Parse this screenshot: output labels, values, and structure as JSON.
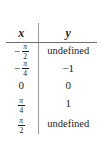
{
  "figure": {
    "kind": "function-value-table",
    "background_color": "#ffffff",
    "rule_color": "#6f6f6f",
    "divider_color": "#9a9a9a",
    "text_color": "#1d1d1d"
  },
  "table": {
    "headers": {
      "x": "x",
      "y": "y"
    },
    "rows": [
      {
        "x_display": "−π/2",
        "x_sign": "−",
        "x_numerator": "π",
        "x_denominator": "2",
        "y_display": "undefined"
      },
      {
        "x_display": "−π/4",
        "x_sign": "−",
        "x_numerator": "π",
        "x_denominator": "4",
        "y_display": "−1"
      },
      {
        "x_display": "0",
        "x_sign": "",
        "x_numerator": "",
        "x_denominator": "",
        "y_display": "0"
      },
      {
        "x_display": "π/4",
        "x_sign": "",
        "x_numerator": "π",
        "x_denominator": "4",
        "y_display": "1"
      },
      {
        "x_display": "π/2",
        "x_sign": "",
        "x_numerator": "π",
        "x_denominator": "2",
        "y_display": "undefined"
      }
    ]
  },
  "chart_data": {
    "type": "table",
    "title": "",
    "xlabel": "x",
    "ylabel": "y",
    "categories": [
      "−π/2",
      "−π/4",
      "0",
      "π/4",
      "π/2"
    ],
    "series": [
      {
        "name": "y",
        "values": [
          "undefined",
          "−1",
          "0",
          "1",
          "undefined"
        ]
      }
    ],
    "columns": [
      "x",
      "y"
    ],
    "rows": [
      [
        "−π/2",
        "undefined"
      ],
      [
        "−π/4",
        "−1"
      ],
      [
        "0",
        "0"
      ],
      [
        "π/4",
        "1"
      ],
      [
        "π/2",
        "undefined"
      ]
    ],
    "grid": false,
    "legend": "none"
  }
}
